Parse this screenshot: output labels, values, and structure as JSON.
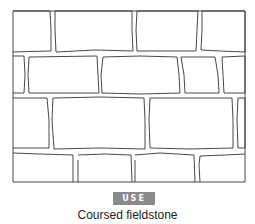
{
  "figure": {
    "title": "Coursed fieldstone",
    "badge": "USE",
    "colors": {
      "line": "#333333",
      "badge_bg": "#8a8a8a",
      "badge_text": "#ffffff",
      "background": "#ffffff"
    },
    "wall": {
      "frame": {
        "x": 13,
        "y": 11,
        "width": 232,
        "height": 171
      },
      "courses": [
        {
          "name": "course-1",
          "y": 11,
          "height": 41,
          "joints_x": [
            52,
            134,
            200
          ]
        },
        {
          "name": "course-2",
          "y": 55,
          "height": 38,
          "joints_x": [
            25,
            100,
            180,
            220
          ]
        },
        {
          "name": "course-3",
          "y": 97,
          "height": 52,
          "joints_x": [
            50,
            148,
            237
          ]
        },
        {
          "name": "course-4",
          "y": 153,
          "height": 29,
          "joints_x": [
            75,
            133,
            198
          ]
        }
      ]
    }
  }
}
